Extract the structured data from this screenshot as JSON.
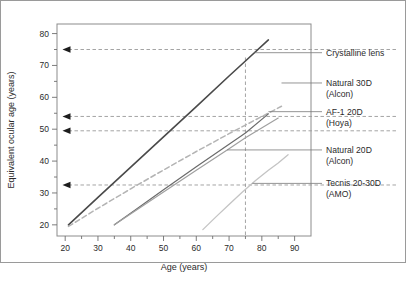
{
  "figure": {
    "outer_border_color": "#9a9a9a",
    "plot_border_color": "#8c8c8c",
    "background": "#ffffff"
  },
  "chart_data": {
    "type": "line",
    "title": "",
    "subtitle": "",
    "xlabel": "Age (years)",
    "ylabel": "Equivalent ocular age (years)",
    "xlim": [
      17.5,
      95
    ],
    "ylim": [
      16.5,
      83
    ],
    "xticks": [
      20,
      30,
      40,
      50,
      60,
      70,
      80,
      90
    ],
    "xticks_labels": [
      "20",
      "30",
      "40",
      "50",
      "60",
      "70",
      "80",
      "90"
    ],
    "xminor_step": 5,
    "yticks": [
      20,
      30,
      40,
      50,
      60,
      70,
      80
    ],
    "yticks_labels": [
      "20",
      "30",
      "40",
      "50",
      "60",
      "70",
      "80"
    ],
    "yminor_step": 5,
    "grid": false,
    "legend_position": "right-outside",
    "series": [
      {
        "name": "Crystalline lens",
        "label_lines": [
          "Crystalline lens"
        ],
        "color": "#4a4a4a",
        "style": "solid",
        "width": 1.6,
        "points": [
          [
            21,
            20.0
          ],
          [
            30,
            28.6
          ],
          [
            40,
            38.1
          ],
          [
            50,
            47.6
          ],
          [
            60,
            57.1
          ],
          [
            70,
            66.7
          ],
          [
            75,
            71.4
          ],
          [
            82,
            78.0
          ]
        ],
        "callout_y": 74.0
      },
      {
        "name": "Natural 30D (Alcon)",
        "label_lines": [
          "Natural 30D",
          "(Alcon)"
        ],
        "color": "#b4b4b4",
        "style": "dashed",
        "width": 1.5,
        "points": [
          [
            21,
            19.5
          ],
          [
            30,
            25.2
          ],
          [
            40,
            31.3
          ],
          [
            50,
            37.2
          ],
          [
            60,
            43.0
          ],
          [
            70,
            48.6
          ],
          [
            75,
            51.3
          ],
          [
            86,
            57.2
          ]
        ],
        "callout_y": 64.5
      },
      {
        "name": "AF-1 20D (Hoya)",
        "label_lines": [
          "AF-1 20D",
          "(Hoya)"
        ],
        "color": "#6b6b6b",
        "style": "solid",
        "width": 1.2,
        "points": [
          [
            35,
            20.0
          ],
          [
            42,
            25.1
          ],
          [
            50,
            31.0
          ],
          [
            60,
            38.2
          ],
          [
            70,
            45.3
          ],
          [
            75,
            48.8
          ],
          [
            82,
            54.8
          ]
        ],
        "callout_y": 55.5
      },
      {
        "name": "Natural 20D (Alcon)",
        "label_lines": [
          "Natural 20D",
          "(Alcon)"
        ],
        "color": "#a0a0a0",
        "style": "solid",
        "width": 1.2,
        "points": [
          [
            35,
            20.0
          ],
          [
            42,
            24.8
          ],
          [
            50,
            30.3
          ],
          [
            60,
            37.1
          ],
          [
            70,
            43.9
          ],
          [
            75,
            47.3
          ],
          [
            85,
            53.5
          ]
        ],
        "callout_y": 43.5
      },
      {
        "name": "Tecnis 20-30D (AMO)",
        "label_lines": [
          "Tecnis 20-30D",
          "(AMO)"
        ],
        "color": "#c4c4c4",
        "style": "solid",
        "width": 1.3,
        "points": [
          [
            62,
            18.5
          ],
          [
            66,
            22.5
          ],
          [
            70,
            26.4
          ],
          [
            74,
            30.2
          ],
          [
            78,
            33.8
          ],
          [
            82,
            37.1
          ],
          [
            85,
            39.4
          ],
          [
            88,
            42.0
          ]
        ],
        "callout_y": 33.0
      }
    ],
    "reference_lines": {
      "vertical": [
        {
          "x": 75,
          "style": "dashed",
          "color": "#9a9a9a",
          "y_from": 16.5,
          "y_to": 72.5
        }
      ],
      "horizontal": [
        {
          "y": 75.0,
          "style": "dashed",
          "color": "#9a9a9a",
          "x_from": 21,
          "x_to": 95,
          "arrow": true
        },
        {
          "y": 54.0,
          "style": "dashed",
          "color": "#9a9a9a",
          "x_from": 21,
          "x_to": 95,
          "arrow": true
        },
        {
          "y": 49.5,
          "style": "dashed",
          "color": "#9a9a9a",
          "x_from": 21,
          "x_to": 95,
          "arrow": true
        },
        {
          "y": 32.5,
          "style": "dashed",
          "color": "#9a9a9a",
          "x_from": 21,
          "x_to": 95,
          "arrow": true
        }
      ]
    },
    "annotations": [
      {
        "text": "Crystalline lens",
        "at_y": 74.0
      },
      {
        "text": "Natural 30D",
        "at_y": 64.5
      },
      {
        "text": "(Alcon)",
        "at_y": 64.5
      },
      {
        "text": "AF-1 20D",
        "at_y": 55.5
      },
      {
        "text": "(Hoya)",
        "at_y": 55.5
      },
      {
        "text": "Natural 20D",
        "at_y": 43.5
      },
      {
        "text": "(Alcon)",
        "at_y": 43.5
      },
      {
        "text": "Tecnis 20-30D",
        "at_y": 33.0
      },
      {
        "text": "(AMO)",
        "at_y": 33.0
      }
    ]
  },
  "legend": {
    "entries": [
      {
        "line1": "Crystalline lens",
        "line2": ""
      },
      {
        "line1": "Natural 30D",
        "line2": "(Alcon)"
      },
      {
        "line1": "AF-1 20D",
        "line2": "(Hoya)"
      },
      {
        "line1": "Natural 20D",
        "line2": "(Alcon)"
      },
      {
        "line1": "Tecnis 20-30D",
        "line2": "(AMO)"
      }
    ]
  },
  "axes": {
    "x_title": "Age (years)",
    "y_title": "Equivalent ocular age (years)",
    "x_tick_labels": [
      "20",
      "30",
      "40",
      "50",
      "60",
      "70",
      "80",
      "90"
    ],
    "y_tick_labels": [
      "20",
      "30",
      "40",
      "50",
      "60",
      "70",
      "80"
    ]
  }
}
